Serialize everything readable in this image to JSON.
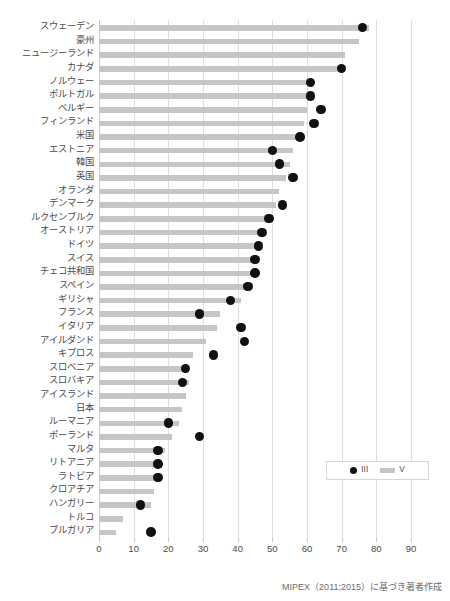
{
  "title": "",
  "source_note": "MIPEX（2011;2015）に基づき著者作成",
  "legend": {
    "position": "bottom-right",
    "items": [
      {
        "label": "III",
        "marker": "dot-marker",
        "color": "#111111"
      },
      {
        "label": "V",
        "marker": "bar-swatch",
        "color": "#c6c6c8"
      }
    ]
  },
  "axis": {
    "ticks": [
      "0",
      "10",
      "20",
      "30",
      "40",
      "50",
      "60",
      "70",
      "80",
      "90"
    ],
    "min": 0,
    "max": 90
  },
  "chart_data": {
    "type": "bar",
    "title": "",
    "xlabel": "",
    "ylabel": "",
    "xlim": [
      0,
      90
    ],
    "grid": true,
    "orientation": "horizontal",
    "legend_position": "bottom-right",
    "categories": [
      "スウェーデン",
      "豪州",
      "ニュージーランド",
      "カナダ",
      "ノルウェー",
      "ポルトガル",
      "ベルギー",
      "フィンランド",
      "米国",
      "エストニア",
      "韓国",
      "英国",
      "オランダ",
      "デンマーク",
      "ルクセンブルク",
      "オーストリア",
      "ドイツ",
      "スイス",
      "チェコ共和国",
      "スペイン",
      "ギリシャ",
      "フランス",
      "イタリア",
      "アイルダンド",
      "キプロス",
      "スロベニア",
      "スロバキア",
      "アイスランド",
      "日本",
      "ルーマニア",
      "ポーランド",
      "マルタ",
      "リトアニア",
      "ラトビア",
      "クロアチア",
      "ハンガリー",
      "トルコ",
      "ブルガリア"
    ],
    "series": [
      {
        "name": "V",
        "type": "bar",
        "color": "#c6c6c8",
        "values": [
          78,
          75,
          71,
          71,
          61,
          61,
          60,
          59,
          57,
          56,
          55,
          54,
          52,
          51,
          50,
          47,
          46,
          45,
          44,
          42,
          41,
          35,
          34,
          31,
          27,
          26,
          26,
          25,
          24,
          23,
          21,
          19,
          18,
          18,
          16,
          15,
          7,
          5
        ]
      },
      {
        "name": "III",
        "type": "scatter",
        "color": "#111111",
        "values": [
          76,
          null,
          null,
          70,
          61,
          61,
          64,
          62,
          58,
          50,
          52,
          56,
          null,
          53,
          49,
          47,
          46,
          45,
          45,
          43,
          38,
          29,
          41,
          42,
          33,
          25,
          24,
          null,
          null,
          20,
          29,
          17,
          17,
          17,
          null,
          12,
          null,
          15
        ]
      }
    ]
  }
}
